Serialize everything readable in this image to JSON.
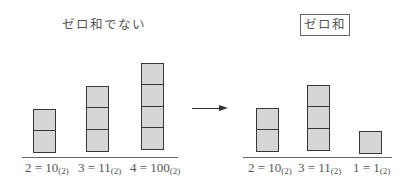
{
  "diagram": {
    "left_panel": {
      "title": "ゼロ和でない",
      "columns": [
        {
          "blocks": 2,
          "label_value": "2 = 10",
          "label_base": "(2)"
        },
        {
          "blocks": 3,
          "label_value": "3 = 11",
          "label_base": "(2)"
        },
        {
          "blocks": 4,
          "label_value": "4 = 100",
          "label_base": "(2)"
        }
      ]
    },
    "arrow": {
      "direction": "right"
    },
    "right_panel": {
      "title": "ゼロ和",
      "title_boxed": true,
      "columns": [
        {
          "blocks": 2,
          "label_value": "2 = 10",
          "label_base": "(2)"
        },
        {
          "blocks": 3,
          "label_value": "3 = 11",
          "label_base": "(2)"
        },
        {
          "blocks": 1,
          "label_value": "1 = 1",
          "label_base": "(2)"
        }
      ]
    },
    "colors": {
      "block_fill": "#d6d6d6",
      "block_border": "#383838",
      "baseline": "#666666",
      "text": "#555555"
    }
  }
}
